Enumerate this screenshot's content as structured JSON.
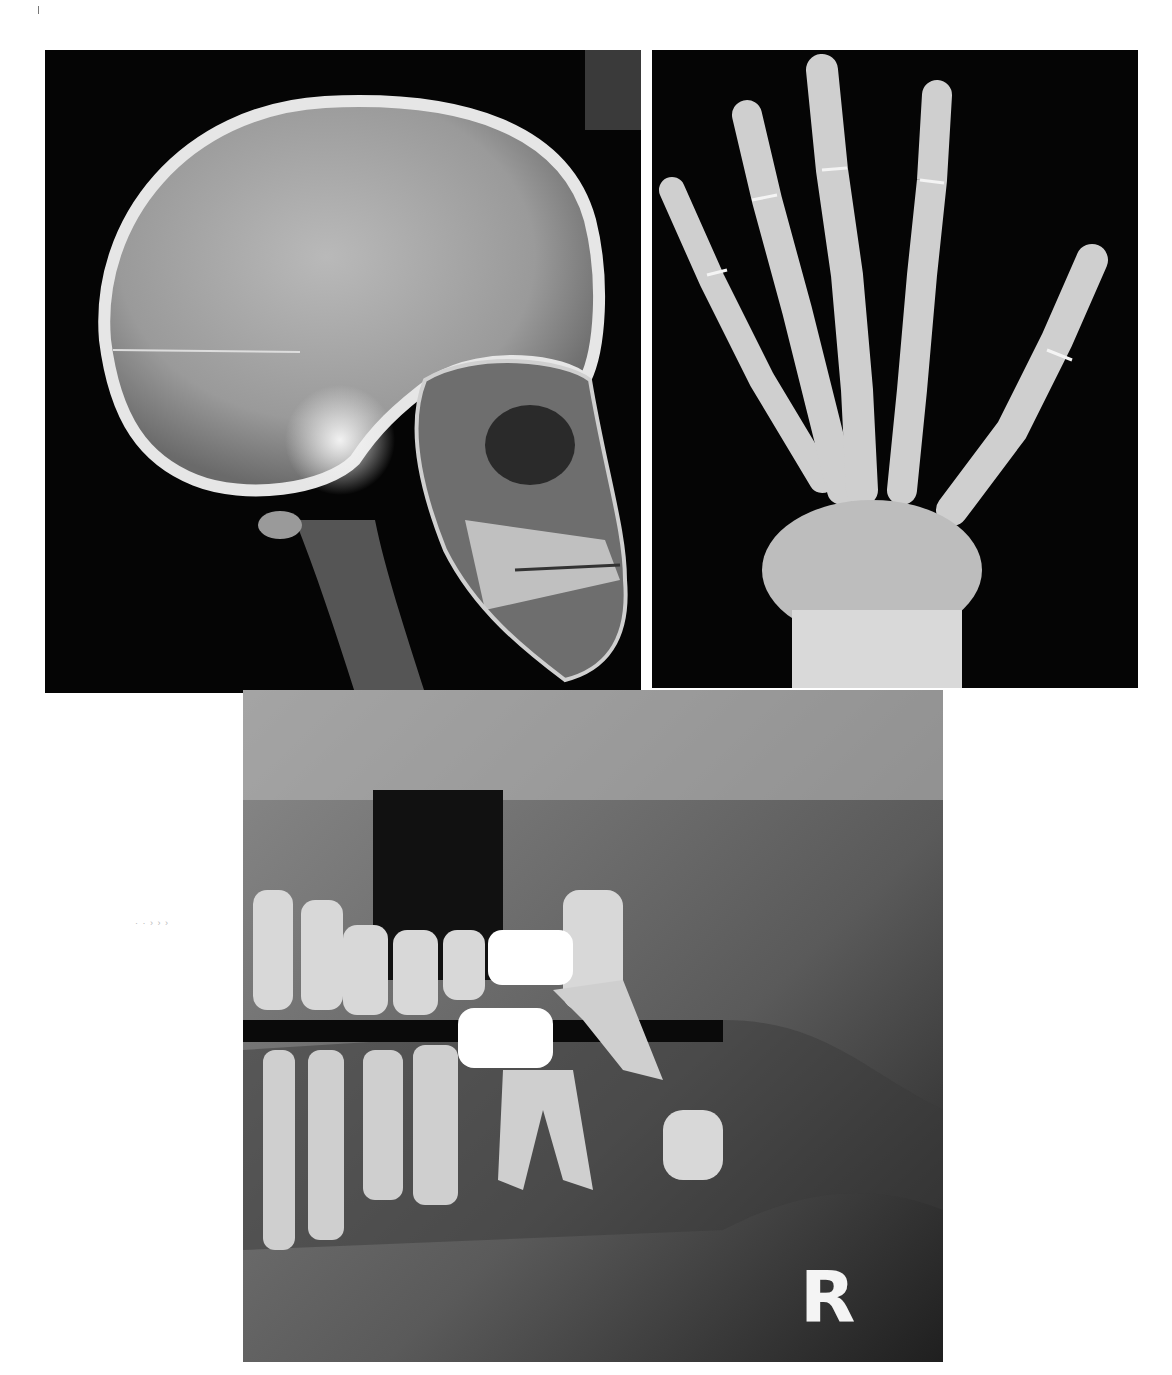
{
  "figure": {
    "panels": [
      {
        "id": "skull",
        "description": "Lateral skull radiograph"
      },
      {
        "id": "hand",
        "description": "Hand and wrist radiograph"
      },
      {
        "id": "dental",
        "description": "Dental panoramic radiograph"
      }
    ],
    "side_marker": "R",
    "margin_mark": "· · › › ›",
    "colors": {
      "background": "#ffffff",
      "film_dark": "#050505",
      "bone": "#e8e8e8"
    }
  }
}
